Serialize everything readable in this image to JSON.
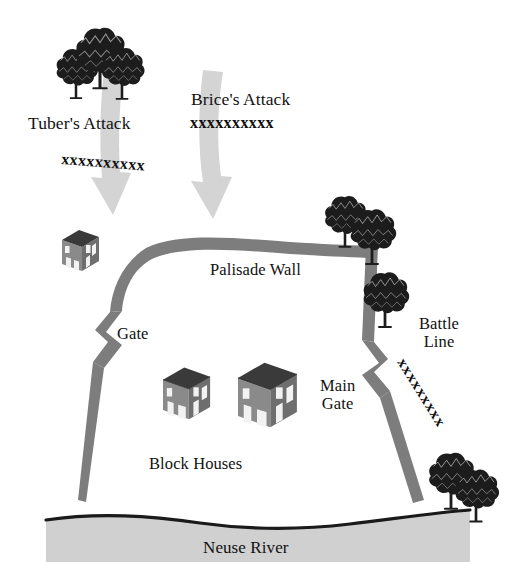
{
  "figure": {
    "type": "historical-battle-map",
    "title_visible": false,
    "background_color": "#ffffff"
  },
  "labels": {
    "tubers_attack": "Tuber's Attack",
    "brices_attack": "Brice's Attack",
    "palisade_wall": "Palisade Wall",
    "gate": "Gate",
    "main_gate": "Main\nGate",
    "block_houses": "Block Houses",
    "battle_line": "Battle\nLine",
    "neuse_river": "Neuse River"
  },
  "troop_marks": {
    "tubers_line": "xxxxxxxxxx",
    "brices_line": "xxxxxxxxxx",
    "battle_line": "xxxxxxxxx"
  },
  "colors": {
    "wall": "#7d7d7d",
    "wall_dark": "#6a6a6a",
    "arrow": "#d4d4d4",
    "river": "#d0d0d0",
    "river_edge": "#1a1a1a",
    "tree": "#1c1c1c",
    "house_roof": "#3a3a3a",
    "house_wall": "#8a8a8a",
    "house_wall_shade": "#6e6e6e",
    "text": "#111111"
  },
  "features": {
    "arrows": [
      {
        "name": "tubers-attack-arrow",
        "direction": "down",
        "target": "northwest-gate"
      },
      {
        "name": "brices-attack-arrow",
        "direction": "down",
        "target": "palisade-wall-north"
      }
    ],
    "buildings": [
      {
        "name": "outpost-house",
        "count": 1,
        "location": "northwest-outside-wall"
      },
      {
        "name": "block-house-left",
        "count": 1,
        "location": "interior"
      },
      {
        "name": "block-house-right",
        "count": 1,
        "location": "interior"
      }
    ],
    "tree_clusters": [
      {
        "name": "tree-cluster-northwest",
        "count": 3
      },
      {
        "name": "tree-cluster-east-upper",
        "count": 2
      },
      {
        "name": "tree-east-lower",
        "count": 1
      },
      {
        "name": "tree-cluster-southeast",
        "count": 2
      }
    ]
  }
}
